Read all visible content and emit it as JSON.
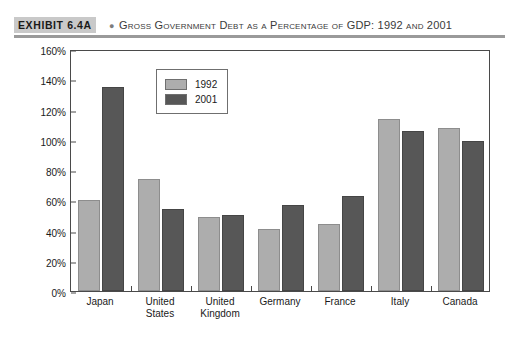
{
  "exhibit": {
    "tag": "EXHIBIT 6.4A",
    "bullet": "●",
    "title": "Gross Government Debt as a Percentage of GDP: 1992 and 2001"
  },
  "colors": {
    "series_1992": "#adadad",
    "series_2001": "#575757",
    "axis": "#4a4a4a",
    "title_band": "#9a9a9a",
    "tag_background": "#c9c9c9"
  },
  "chart_data": {
    "type": "bar",
    "title": "Gross Government Debt as a Percentage of GDP: 1992 and 2001",
    "xlabel": "",
    "ylabel": "Percentage of GDP",
    "ylim": [
      0,
      160
    ],
    "ytick_step": 20,
    "ytick_labels": [
      "0%",
      "20%",
      "40%",
      "60%",
      "80%",
      "100%",
      "120%",
      "140%",
      "160%"
    ],
    "ytick_values": [
      0,
      20,
      40,
      60,
      80,
      100,
      120,
      140,
      160
    ],
    "grid": false,
    "legend_position": "top-left-inside",
    "categories": [
      "Japan",
      "United States",
      "United Kingdom",
      "Germany",
      "France",
      "Italy",
      "Canada"
    ],
    "category_lines": [
      [
        "Japan"
      ],
      [
        "United",
        "States"
      ],
      [
        "United",
        "Kingdom"
      ],
      [
        "Germany"
      ],
      [
        "France"
      ],
      [
        "Italy"
      ],
      [
        "Canada"
      ]
    ],
    "series": [
      {
        "name": "1992",
        "color": "#adadad",
        "values": [
          60,
          74,
          49,
          41,
          44,
          114,
          108
        ]
      },
      {
        "name": "2001",
        "color": "#575757",
        "values": [
          135,
          54,
          50,
          57,
          63,
          106,
          99
        ]
      }
    ]
  }
}
